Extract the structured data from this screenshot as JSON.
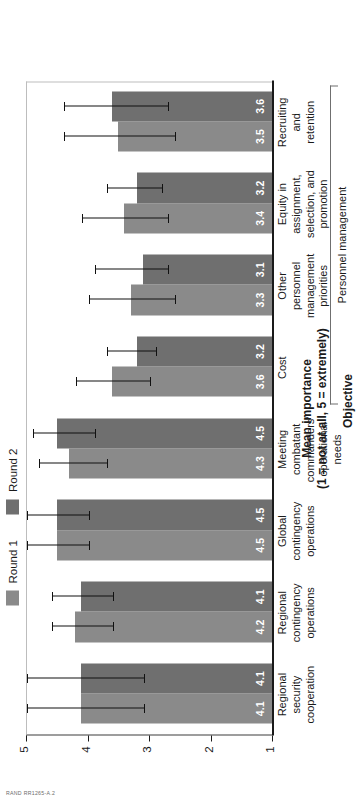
{
  "figure": {
    "rand_tag": "RAND RR1265-A.2"
  },
  "legend": {
    "items": [
      {
        "label": "Round 1",
        "color": "#8a8a8a"
      },
      {
        "label": "Round 2",
        "color": "#6f6f6f"
      }
    ]
  },
  "axes": {
    "value_axis_title_line1": "Mean importance",
    "value_axis_title_line2": "(1 = not at all, 5 = extremely)",
    "category_axis_title": "Objective",
    "value_ticks": [
      "1",
      "2",
      "3",
      "4",
      "5"
    ]
  },
  "bracket": {
    "label": "Personnel management"
  },
  "chart_data": {
    "type": "bar",
    "title": "",
    "xlabel": "Objective",
    "ylabel": "Mean importance (1 = not at all, 5 = extremely)",
    "ylim": [
      1,
      5
    ],
    "grid": true,
    "legend_position": "top-left",
    "orientation": "vertical-bars-rotated-page",
    "categories": [
      "Regional security cooperation",
      "Regional contingency operations",
      "Global contingency operations",
      "Meeting combatant commanders' operational needs",
      "Cost",
      "Other personnel management priorities",
      "Equity in assignment, selection, and promotion",
      "Recruiting and retention"
    ],
    "category_label_lines": [
      [
        "Regional",
        "security",
        "cooperation"
      ],
      [
        "Regional",
        "contingency",
        "operations"
      ],
      [
        "Global",
        "contingency",
        "operations"
      ],
      [
        "Meeting",
        "combatant",
        "commanders'",
        "operational",
        "needs"
      ],
      [
        "Cost"
      ],
      [
        "Other",
        "personnel",
        "management",
        "priorities"
      ],
      [
        "Equity in",
        "assignment,",
        "selection, and",
        "promotion"
      ],
      [
        "Recruiting",
        "and",
        "retention"
      ]
    ],
    "series": [
      {
        "name": "Round 1",
        "color": "#8a8a8a",
        "values": [
          4.1,
          4.2,
          4.5,
          4.3,
          3.6,
          3.3,
          3.4,
          3.5
        ],
        "error_low": [
          3.1,
          3.6,
          4.0,
          3.7,
          3.0,
          2.6,
          2.7,
          2.6
        ],
        "error_high": [
          5.0,
          4.6,
          5.0,
          4.8,
          4.2,
          4.0,
          4.1,
          4.4
        ]
      },
      {
        "name": "Round 2",
        "color": "#6f6f6f",
        "values": [
          4.1,
          4.1,
          4.5,
          4.5,
          3.2,
          3.1,
          3.2,
          3.6
        ],
        "error_low": [
          3.1,
          3.6,
          4.0,
          3.9,
          2.9,
          2.7,
          2.8,
          2.7
        ],
        "error_high": [
          5.0,
          4.6,
          5.0,
          4.9,
          3.7,
          3.9,
          3.7,
          4.4
        ]
      }
    ],
    "bracket_groups": [
      {
        "label": "Personnel management",
        "from_index": 4,
        "to_index": 7
      }
    ]
  }
}
